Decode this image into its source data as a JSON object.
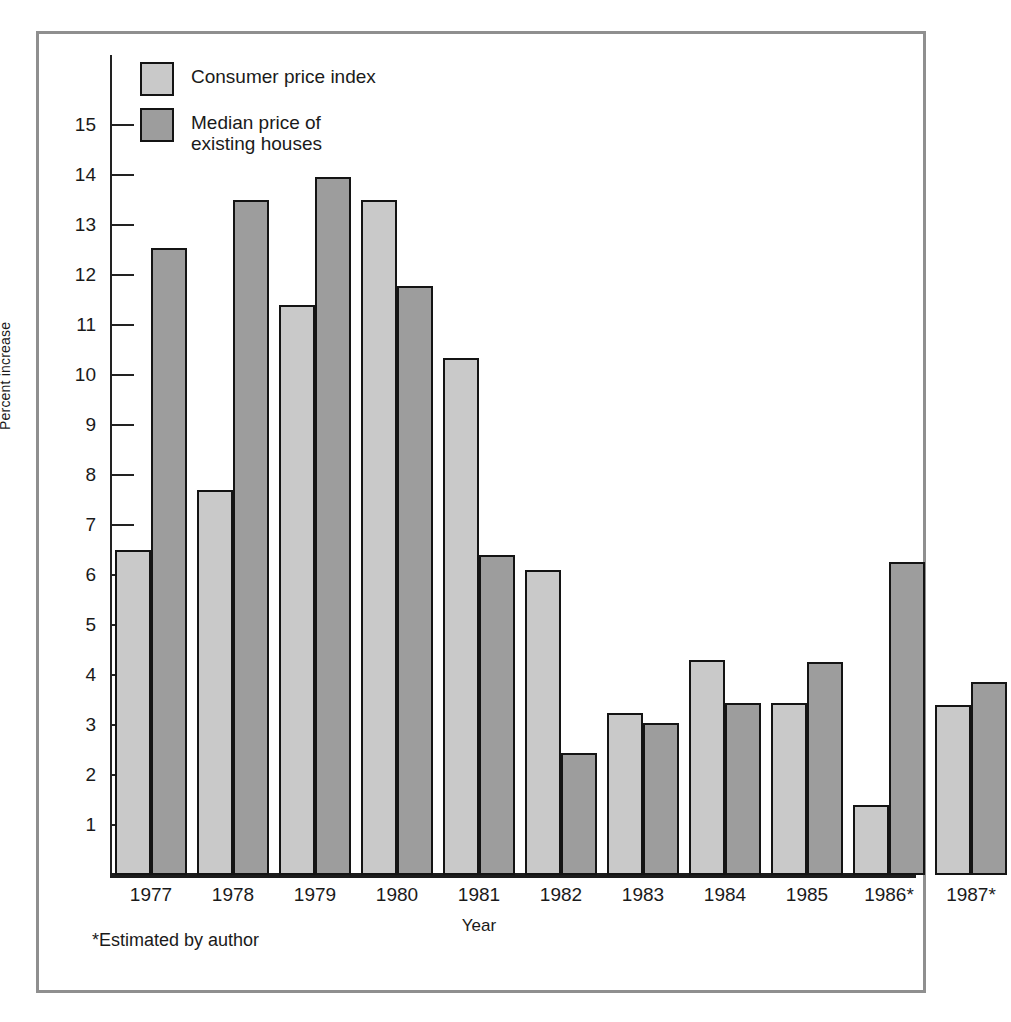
{
  "chart_data": {
    "type": "bar",
    "title": "",
    "xlabel": "Year",
    "ylabel": "Percent increase",
    "categories": [
      "1977",
      "1978",
      "1979",
      "1980",
      "1981",
      "1982",
      "1983",
      "1984",
      "1985",
      "1986*",
      "1987*"
    ],
    "series": [
      {
        "name": "Consumer price index",
        "color": "#c9c9c9",
        "values": [
          6.5,
          7.7,
          11.4,
          13.5,
          10.35,
          6.1,
          3.25,
          4.3,
          3.45,
          1.4,
          3.4
        ]
      },
      {
        "name": "Median price of\nexisting houses",
        "color": "#9d9d9d",
        "values": [
          12.55,
          13.5,
          13.97,
          11.78,
          6.4,
          2.45,
          3.05,
          3.45,
          4.27,
          6.27,
          3.87
        ]
      }
    ],
    "ylim": [
      0,
      15.8
    ],
    "yticks": [
      1,
      2,
      3,
      4,
      5,
      6,
      7,
      8,
      9,
      10,
      11,
      12,
      13,
      14,
      15
    ],
    "ytick_labels": [
      "1",
      "2",
      "3",
      "4",
      "5",
      "6",
      "7",
      "8",
      "9",
      "10",
      "11",
      "12",
      "13",
      "14",
      "15"
    ],
    "grid": false,
    "legend_position": "top-left",
    "footnote": "*Estimated by author"
  },
  "legend": {
    "items": [
      {
        "label": "Consumer price index",
        "swatch": "cpi"
      },
      {
        "label": "Median price of\nexisting houses",
        "swatch": "house"
      }
    ]
  },
  "axes": {
    "y_title": "Percent increase",
    "x_title": "Year"
  },
  "footnote": "*Estimated by author"
}
